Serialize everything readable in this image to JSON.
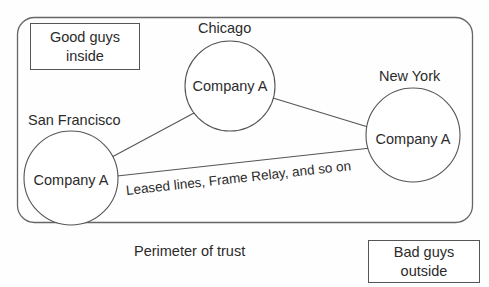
{
  "diagram": {
    "title_text_present": false,
    "trust_boundary": {
      "name": "Perimeter of trust",
      "caption": "Perimeter of trust"
    },
    "annotations": {
      "inside": "Good guys\ninside",
      "inside_line1": "Good guys",
      "inside_line2": "inside",
      "outside": "Bad guys\noutside",
      "outside_line1": "Bad guys",
      "outside_line2": "outside"
    },
    "nodes": [
      {
        "id": "san-francisco",
        "city": "San Francisco",
        "label": "Company A",
        "cx": 71,
        "cy": 178,
        "r": 47
      },
      {
        "id": "chicago",
        "city": "Chicago",
        "label": "Company A",
        "cx": 230,
        "cy": 86,
        "r": 45
      },
      {
        "id": "new-york",
        "city": "New York",
        "label": "Company A",
        "cx": 413,
        "cy": 135,
        "r": 47
      }
    ],
    "links": [
      {
        "id": "sf-chicago",
        "from": "san-francisco",
        "to": "chicago",
        "label": ""
      },
      {
        "id": "chicago-ny",
        "from": "chicago",
        "to": "new-york",
        "label": ""
      },
      {
        "id": "sf-ny",
        "from": "san-francisco",
        "to": "new-york",
        "label": "Leased lines, Frame Relay, and so on"
      }
    ],
    "colors": {
      "stroke": "#555555",
      "text": "#2b2b2b",
      "background": "#fefefe"
    }
  }
}
